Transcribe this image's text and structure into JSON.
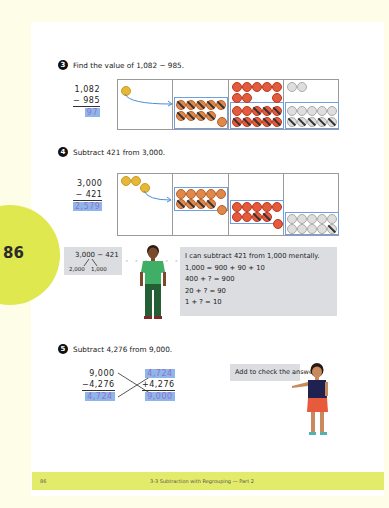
{
  "page": {
    "number": "86",
    "tab_number": "86",
    "footer_title": "3-3 Subtraction with Regrouping — Part 2"
  },
  "problem3": {
    "badge": "3",
    "prompt": "Find the value of 1,082 − 985.",
    "minuend": "1,082",
    "subtrahend": "− 985",
    "answer": "97"
  },
  "problem4": {
    "badge": "4",
    "prompt": "Subtract 421 from 3,000.",
    "minuend": "3,000",
    "subtrahend": "−  421",
    "answer": "2,579",
    "thought_left": {
      "expression": "3,000 − 421",
      "split_left": "2,000",
      "split_right": "1,000"
    },
    "thought_right": {
      "lines": [
        "I can subtract 421 from 1,000 mentally.",
        "1,000 = 900 + 90 + 10",
        "400 + ? = 900",
        "20 + ? = 90",
        "1 + ? = 10"
      ]
    }
  },
  "problem5": {
    "badge": "5",
    "prompt": "Subtract 4,276 from 9,000.",
    "left": {
      "minuend": "9,000",
      "subtrahend": "−4,276",
      "answer": "4,724"
    },
    "right": {
      "addend1": "4,724",
      "addend2": "+4,276",
      "sum": "9,000"
    },
    "speech": "Add to check the answer."
  },
  "colors": {
    "tab": "#dfe84f",
    "footer": "#e3eb6b",
    "answer_highlight": "#8fb6ea",
    "answer_text": "#8e72c9",
    "bubble": "#dcdde0"
  }
}
